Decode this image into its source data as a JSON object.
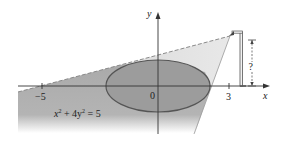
{
  "figure": {
    "axes": {
      "x_label": "x",
      "y_label": "y",
      "origin_label": "0",
      "ticks": [
        {
          "value": -5,
          "label": "−5"
        },
        {
          "value": 3,
          "label": "3"
        }
      ]
    },
    "ellipse": {
      "equation_lhs": "x",
      "equation_parts": [
        "x",
        "2",
        " + 4y",
        "2",
        " = 5"
      ],
      "equation_text": "x² + 4y² = 5"
    },
    "lamp": {
      "height_label": "?"
    },
    "colors": {
      "dark_shade": "#a9a9a9",
      "light_shade": "#d6d6d6",
      "ellipse_fill": "#9c9c9c",
      "ellipse_stroke": "#555555",
      "axis": "#333333",
      "dashed_line": "#8a8a8a",
      "lamp_post": "#555555"
    }
  }
}
